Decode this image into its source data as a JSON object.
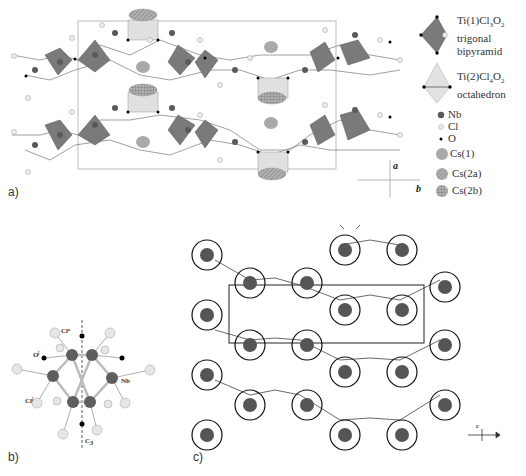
{
  "figure": {
    "panels": [
      {
        "id": "a",
        "label": "a)"
      },
      {
        "id": "b",
        "label": "b)"
      },
      {
        "id": "c",
        "label": "c)"
      }
    ],
    "legend": {
      "polyhedra": [
        {
          "formula_main": "Ti(1)Cl",
          "sub1": "3",
          "mid": "O",
          "sub2": "2",
          "desc_line1": "trigonal",
          "desc_line2": "bipyramid",
          "color": "#7d7d7d"
        },
        {
          "formula_main": "Ti(2)Cl",
          "sub1": "4",
          "mid": "O",
          "sub2": "2",
          "desc_line1": "octahedron",
          "desc_line2": "",
          "color": "#d9d9d9"
        }
      ],
      "atoms": [
        {
          "label": "Nb",
          "color": "#5a5a5a"
        },
        {
          "label": "Cl",
          "color": "#e6e6e6"
        },
        {
          "label": "O",
          "color": "#000000"
        },
        {
          "label": "Cs(1)",
          "color": "#a9a9a9",
          "pattern": "solid"
        },
        {
          "label": "Cs(2a)",
          "color": "#a9a9a9",
          "pattern": "hatched"
        },
        {
          "label": "Cs(2b)",
          "color": "#a9a9a9",
          "pattern": "cross-hatched"
        }
      ]
    },
    "axes_a": {
      "vertical": "a",
      "horizontal": "b"
    },
    "axes_c": {
      "vertical": "c",
      "horizontal": "b"
    },
    "panel_b_labels": {
      "cl_top": "Clᵃ",
      "o_left": "Oⁱ",
      "nb": "Nb",
      "cl_left": "Clⁱ",
      "c_axis": "C",
      "c_axis_sub": "3"
    }
  }
}
